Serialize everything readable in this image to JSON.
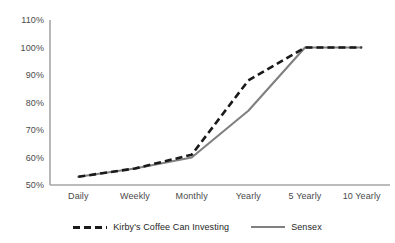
{
  "chart_data": {
    "type": "line",
    "title": "",
    "xlabel": "",
    "ylabel": "",
    "categories": [
      "Daily",
      "Weekly",
      "Monthly",
      "Yearly",
      "5 Yearly",
      "10 Yearly"
    ],
    "ylim": [
      50,
      110
    ],
    "yticks": [
      "50%",
      "60%",
      "70%",
      "80%",
      "90%",
      "100%",
      "110%"
    ],
    "ytick_values": [
      50,
      60,
      70,
      80,
      90,
      100,
      110
    ],
    "grid": false,
    "legend_position": "bottom",
    "series": [
      {
        "name": "Kirby's Coffee Can Investing",
        "values": [
          53,
          56,
          61,
          88,
          100,
          100
        ],
        "color": "#1a1a1a",
        "style": "dashed"
      },
      {
        "name": "Sensex",
        "values": [
          53,
          56,
          60,
          77,
          100,
          100
        ],
        "color": "#808080",
        "style": "solid"
      }
    ]
  },
  "axis": {
    "line_color": "#a6a6a6",
    "tick_label_color": "#4a4a4a"
  },
  "legend": {
    "items": [
      {
        "label": "Kirby's Coffee Can Investing",
        "swatch": "dashed-line-swatch"
      },
      {
        "label": "Sensex",
        "swatch": "solid-line-swatch"
      }
    ]
  }
}
